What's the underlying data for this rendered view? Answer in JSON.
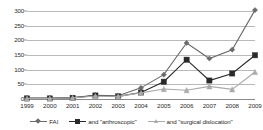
{
  "chart_data": {
    "type": "line",
    "title": "",
    "subtitle": "",
    "xlabel": "",
    "ylabel": "",
    "categories": [
      "1999",
      "2000",
      "2001",
      "2002",
      "2003",
      "2004",
      "2005",
      "2006",
      "2007",
      "2008",
      "2009"
    ],
    "x": [
      1999,
      2000,
      2001,
      2002,
      2003,
      2004,
      2005,
      2006,
      2007,
      2008,
      2009
    ],
    "ylim": [
      0,
      300
    ],
    "yticks": [
      0,
      50,
      100,
      150,
      200,
      250,
      300
    ],
    "ytick_labels": [
      "0",
      "50",
      "100",
      "150",
      "200",
      "250",
      "300"
    ],
    "grid": true,
    "legend_position": "bottom",
    "series": [
      {
        "name": "FAI",
        "color": "#6b6b6b",
        "marker": "diamond",
        "values": [
          3,
          3,
          5,
          13,
          11,
          38,
          83,
          191,
          138,
          168,
          303
        ]
      },
      {
        "name": "and \"arthroscopic\"",
        "color": "#2a2a2a",
        "marker": "square",
        "values": [
          2,
          2,
          4,
          12,
          9,
          22,
          59,
          134,
          63,
          87,
          149
        ]
      },
      {
        "name": "and \"surgical dislocation\"",
        "color": "#aaaaaa",
        "marker": "triangle",
        "values": [
          2,
          2,
          4,
          10,
          9,
          21,
          34,
          30,
          43,
          33,
          92
        ]
      }
    ]
  },
  "legend": {
    "items": [
      {
        "label": "FAI"
      },
      {
        "label": "and \"arthroscopic\""
      },
      {
        "label": "and \"surgical dislocation\""
      }
    ]
  },
  "colors": {
    "series_fai": "#6b6b6b",
    "series_arthroscopic": "#2a2a2a",
    "series_surgical_dislocation": "#aaaaaa",
    "gridline": "#b9b9b9",
    "axis": "#8a8a8a",
    "text": "#2b2b2b",
    "background": "#ffffff"
  }
}
